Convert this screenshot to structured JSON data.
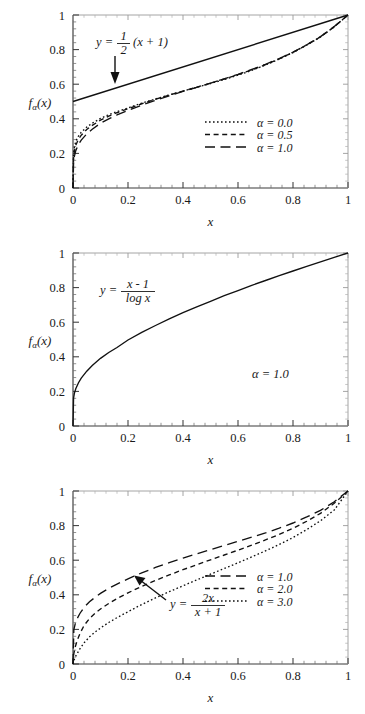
{
  "figure": {
    "panel_count": 3,
    "background": "#ffffff",
    "ink": "#111111"
  },
  "chart_data": [
    {
      "panel": 1,
      "type": "line",
      "title": "",
      "xlabel": "x",
      "ylabel": "f_alpha(x)",
      "ylabel_display": "f",
      "ylabel_sub": "α",
      "ylabel_tail": "(x)",
      "xlim": [
        0,
        1
      ],
      "ylim": [
        0,
        1
      ],
      "grid": false,
      "xticks": [
        0,
        0.2,
        0.4,
        0.6,
        0.8,
        1
      ],
      "xtick_labels": [
        "0",
        "0.2",
        "0.4",
        "0.6",
        "0.8",
        "1"
      ],
      "yticks": [
        0,
        0.2,
        0.4,
        0.6,
        0.8,
        1
      ],
      "ytick_labels": [
        "0",
        "0.2",
        "0.4",
        "0.6",
        "0.8",
        "1"
      ],
      "minor_per_major": 5,
      "annotation": {
        "lhs": "y =",
        "numerator": "1",
        "denominator": "2",
        "tail": "(x + 1)",
        "arrow": true
      },
      "legend": {
        "position": "center-right",
        "entries": [
          {
            "label": "α = 0.0",
            "dash": "dotted"
          },
          {
            "label": "α = 0.5",
            "dash": "dashed"
          },
          {
            "label": "α = 1.0",
            "dash": "longdash"
          }
        ]
      },
      "series": [
        {
          "name": "α = 0.0",
          "dash": "dotted",
          "x": [
            0.0,
            0.002,
            0.005,
            0.01,
            0.02,
            0.03,
            0.05,
            0.07,
            0.1,
            0.13,
            0.16,
            0.2,
            0.25,
            0.3,
            0.35,
            0.4,
            0.45,
            0.5,
            0.55,
            0.6,
            0.65,
            0.7,
            0.75,
            0.8,
            0.85,
            0.9,
            0.95,
            1.0
          ],
          "y": [
            0.0,
            0.2,
            0.235,
            0.27,
            0.3,
            0.322,
            0.352,
            0.375,
            0.402,
            0.424,
            0.442,
            0.463,
            0.49,
            0.515,
            0.538,
            0.56,
            0.582,
            0.604,
            0.627,
            0.652,
            0.68,
            0.711,
            0.745,
            0.783,
            0.826,
            0.873,
            0.932,
            1.0
          ]
        },
        {
          "name": "α = 0.5",
          "dash": "dashed",
          "x": [
            0.0,
            0.002,
            0.005,
            0.01,
            0.02,
            0.03,
            0.05,
            0.07,
            0.1,
            0.13,
            0.16,
            0.2,
            0.25,
            0.3,
            0.35,
            0.4,
            0.45,
            0.5,
            0.55,
            0.6,
            0.65,
            0.7,
            0.75,
            0.8,
            0.85,
            0.9,
            0.95,
            1.0
          ],
          "y": [
            0.0,
            0.175,
            0.212,
            0.248,
            0.282,
            0.305,
            0.338,
            0.362,
            0.392,
            0.415,
            0.435,
            0.458,
            0.487,
            0.513,
            0.537,
            0.56,
            0.583,
            0.606,
            0.63,
            0.655,
            0.683,
            0.713,
            0.747,
            0.784,
            0.827,
            0.874,
            0.932,
            1.0
          ]
        },
        {
          "name": "α = 1.0",
          "dash": "longdash",
          "x": [
            0.0,
            0.002,
            0.005,
            0.01,
            0.02,
            0.03,
            0.05,
            0.07,
            0.1,
            0.13,
            0.16,
            0.2,
            0.25,
            0.3,
            0.35,
            0.4,
            0.45,
            0.5,
            0.55,
            0.6,
            0.65,
            0.7,
            0.75,
            0.8,
            0.85,
            0.9,
            0.95,
            1.0
          ],
          "y": [
            0.0,
            0.147,
            0.183,
            0.216,
            0.252,
            0.277,
            0.313,
            0.34,
            0.374,
            0.4,
            0.422,
            0.448,
            0.479,
            0.507,
            0.533,
            0.558,
            0.582,
            0.606,
            0.631,
            0.657,
            0.685,
            0.715,
            0.748,
            0.785,
            0.828,
            0.875,
            0.933,
            1.0
          ]
        },
        {
          "name": "y = (x+1)/2",
          "dash": "solid",
          "x": [
            0,
            1
          ],
          "y": [
            0.5,
            1.0
          ]
        }
      ]
    },
    {
      "panel": 2,
      "type": "line",
      "title": "",
      "xlabel": "x",
      "ylabel": "f_alpha(x)",
      "ylabel_display": "f",
      "ylabel_sub": "α",
      "ylabel_tail": "(x)",
      "xlim": [
        0,
        1
      ],
      "ylim": [
        0,
        1
      ],
      "grid": false,
      "xticks": [
        0,
        0.2,
        0.4,
        0.6,
        0.8,
        1
      ],
      "xtick_labels": [
        "0",
        "0.2",
        "0.4",
        "0.6",
        "0.8",
        "1"
      ],
      "yticks": [
        0,
        0.2,
        0.4,
        0.6,
        0.8,
        1
      ],
      "ytick_labels": [
        "0",
        "0.2",
        "0.4",
        "0.6",
        "0.8",
        "1"
      ],
      "minor_per_major": 5,
      "annotation": {
        "lhs": "y =",
        "numerator": "x - 1",
        "denominator": "log x",
        "arrow": false
      },
      "corner_label": "α = 1.0",
      "series": [
        {
          "name": "(x-1)/log x",
          "dash": "solid",
          "x": [
            0.0,
            0.002,
            0.005,
            0.01,
            0.02,
            0.03,
            0.05,
            0.07,
            0.1,
            0.13,
            0.16,
            0.2,
            0.25,
            0.3,
            0.35,
            0.4,
            0.45,
            0.5,
            0.55,
            0.6,
            0.65,
            0.7,
            0.75,
            0.8,
            0.85,
            0.9,
            0.95,
            1.0
          ],
          "y": [
            0.0,
            0.161,
            0.189,
            0.215,
            0.25,
            0.277,
            0.317,
            0.35,
            0.391,
            0.425,
            0.454,
            0.497,
            0.541,
            0.581,
            0.619,
            0.655,
            0.689,
            0.721,
            0.753,
            0.783,
            0.813,
            0.841,
            0.869,
            0.896,
            0.923,
            0.949,
            0.975,
            1.0
          ]
        }
      ]
    },
    {
      "panel": 3,
      "type": "line",
      "title": "",
      "xlabel": "x",
      "ylabel": "f_alpha(x)",
      "ylabel_display": "f",
      "ylabel_sub": "α",
      "ylabel_tail": "(x)",
      "xlim": [
        0,
        1
      ],
      "ylim": [
        0,
        1
      ],
      "grid": false,
      "xticks": [
        0,
        0.2,
        0.4,
        0.6,
        0.8,
        1
      ],
      "xtick_labels": [
        "0",
        "0.2",
        "0.4",
        "0.6",
        "0.8",
        "1"
      ],
      "yticks": [
        0,
        0.2,
        0.4,
        0.6,
        0.8,
        1
      ],
      "ytick_labels": [
        "0",
        "0.2",
        "0.4",
        "0.6",
        "0.8",
        "1"
      ],
      "minor_per_major": 5,
      "annotation": {
        "lhs": "y =",
        "numerator": "2x",
        "denominator": "x + 1",
        "arrow": true
      },
      "legend": {
        "position": "center-right",
        "entries": [
          {
            "label": "α = 1.0",
            "dash": "longdash"
          },
          {
            "label": "α = 2.0",
            "dash": "dashed"
          },
          {
            "label": "α = 3.0",
            "dash": "dotted"
          }
        ]
      },
      "series": [
        {
          "name": "α = 1.0",
          "dash": "longdash",
          "x": [
            0.0,
            0.003,
            0.008,
            0.015,
            0.025,
            0.04,
            0.06,
            0.08,
            0.1,
            0.13,
            0.16,
            0.2,
            0.25,
            0.3,
            0.35,
            0.4,
            0.45,
            0.5,
            0.55,
            0.6,
            0.65,
            0.7,
            0.75,
            0.8,
            0.85,
            0.9,
            0.95,
            1.0
          ],
          "y": [
            0.0,
            0.198,
            0.232,
            0.262,
            0.292,
            0.327,
            0.36,
            0.385,
            0.408,
            0.437,
            0.462,
            0.492,
            0.527,
            0.558,
            0.586,
            0.612,
            0.637,
            0.661,
            0.685,
            0.709,
            0.733,
            0.758,
            0.785,
            0.815,
            0.85,
            0.888,
            0.938,
            1.0
          ]
        },
        {
          "name": "α = 2.0",
          "dash": "dashed",
          "x": [
            0.0,
            0.003,
            0.008,
            0.015,
            0.025,
            0.04,
            0.06,
            0.08,
            0.1,
            0.13,
            0.16,
            0.2,
            0.25,
            0.3,
            0.35,
            0.4,
            0.45,
            0.5,
            0.55,
            0.6,
            0.65,
            0.7,
            0.75,
            0.8,
            0.85,
            0.9,
            0.95,
            1.0
          ],
          "y": [
            0.0,
            0.06,
            0.098,
            0.135,
            0.175,
            0.222,
            0.263,
            0.293,
            0.318,
            0.35,
            0.378,
            0.411,
            0.449,
            0.483,
            0.515,
            0.545,
            0.574,
            0.602,
            0.63,
            0.658,
            0.687,
            0.717,
            0.749,
            0.784,
            0.825,
            0.871,
            0.929,
            1.0
          ]
        },
        {
          "name": "α = 3.0",
          "dash": "dotted",
          "x": [
            0.0,
            0.003,
            0.008,
            0.015,
            0.025,
            0.04,
            0.06,
            0.08,
            0.1,
            0.13,
            0.16,
            0.2,
            0.25,
            0.3,
            0.35,
            0.4,
            0.45,
            0.5,
            0.55,
            0.6,
            0.65,
            0.7,
            0.75,
            0.8,
            0.85,
            0.9,
            0.95,
            1.0
          ],
          "y": [
            0.0,
            0.02,
            0.04,
            0.06,
            0.087,
            0.122,
            0.157,
            0.184,
            0.208,
            0.24,
            0.268,
            0.302,
            0.344,
            0.382,
            0.418,
            0.452,
            0.486,
            0.519,
            0.552,
            0.585,
            0.619,
            0.654,
            0.691,
            0.731,
            0.777,
            0.828,
            0.89,
            1.0
          ]
        }
      ]
    }
  ]
}
